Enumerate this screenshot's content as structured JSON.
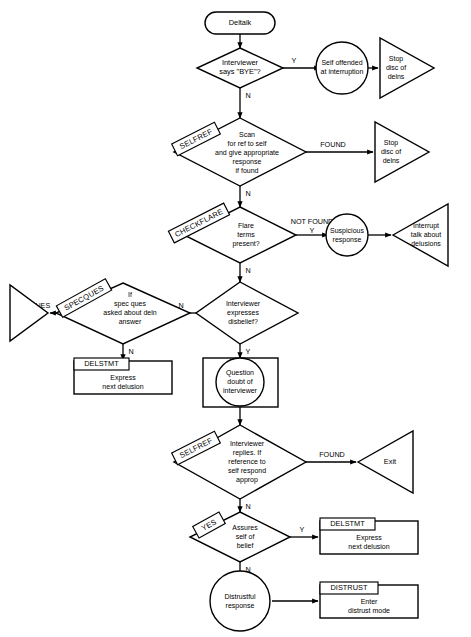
{
  "diagram": {
    "title": "Deltalk",
    "type": "flowchart",
    "orientation": "top-to-bottom"
  },
  "nodes": {
    "start": {
      "label": "Deltalk",
      "shape": "rounded-terminator"
    },
    "d_bye": {
      "label_lines": [
        "Interviewer",
        "says \"BYE\"?"
      ],
      "shape": "decision"
    },
    "c_offended": {
      "label_lines": [
        "Self offended",
        "at interruption"
      ],
      "shape": "circle"
    },
    "t_stop1": {
      "label_lines": [
        "Stop",
        "disc of",
        "delns"
      ],
      "shape": "triangle-right"
    },
    "d_selfref1": {
      "tag": "SELFREF",
      "label_lines": [
        "Scan",
        "for ref to self",
        "and give appropriate",
        "response",
        "if found"
      ],
      "shape": "decision"
    },
    "t_stop2": {
      "label_lines": [
        "Stop",
        "disc of",
        "delns"
      ],
      "shape": "triangle-right"
    },
    "d_checkflare": {
      "tag": "CHECKFLARE",
      "label_lines": [
        "Flare",
        "terms",
        "present?"
      ],
      "shape": "decision"
    },
    "c_suspicious": {
      "label_lines": [
        "Suspicious",
        "response"
      ],
      "shape": "circle"
    },
    "t_interrupt": {
      "label_lines": [
        "Interrupt",
        "talk about",
        "delusions"
      ],
      "shape": "triangle-left"
    },
    "d_specques": {
      "tag": "SPECQUES",
      "label_lines": [
        "If",
        "spec ques",
        "asked about deln",
        "answer"
      ],
      "shape": "decision"
    },
    "t_ques": {
      "label": "QUES",
      "shape": "triangle-right",
      "label_position": "right-outside"
    },
    "b_delstmt1": {
      "header": "DELSTMT",
      "label_lines": [
        "Express",
        "next delusion"
      ],
      "shape": "box-with-header"
    },
    "d_disbelief": {
      "label_lines": [
        "Interviewer",
        "expresses",
        "disbelief?"
      ],
      "shape": "decision"
    },
    "c_question": {
      "label_lines": [
        "Question",
        "doubt of",
        "interviewer"
      ],
      "shape": "circle-in-box"
    },
    "d_selfref2": {
      "tag": "SELFREF",
      "label_lines": [
        "Interviewer",
        "replies. If",
        "reference to",
        "self respond",
        "approp"
      ],
      "shape": "decision"
    },
    "t_exit": {
      "label": "Exit",
      "shape": "triangle-left"
    },
    "d_assures": {
      "tag": "YES",
      "label_lines": [
        "Assures",
        "self of",
        "belief"
      ],
      "shape": "decision"
    },
    "b_delstmt2": {
      "header": "DELSTMT",
      "label_lines": [
        "Express",
        "next delusion"
      ],
      "shape": "box-with-header"
    },
    "c_distrustful": {
      "label_lines": [
        "Distrustful",
        "response"
      ],
      "shape": "circle"
    },
    "b_distrust": {
      "header": "DISTRUST",
      "label_lines": [
        "Enter",
        "distrust mode"
      ],
      "shape": "box-with-header"
    }
  },
  "edge_labels": {
    "bye_yes": "Y",
    "bye_no": "N",
    "selfref1_found": "FOUND",
    "selfref1_no": "N",
    "checkflare_notfound": "NOT FOUND",
    "checkflare_y": "Y",
    "checkflare_no": "N",
    "disbelief_no": "N",
    "disbelief_yes": "Y",
    "specques_no": "N",
    "specques_ques": "QUES",
    "selfref2_found": "FOUND",
    "selfref2_no": "N",
    "assures_yes": "Y",
    "assures_no": "N"
  },
  "style": {
    "stroke": "#000000",
    "fill": "#ffffff",
    "background": "#ffffff"
  }
}
